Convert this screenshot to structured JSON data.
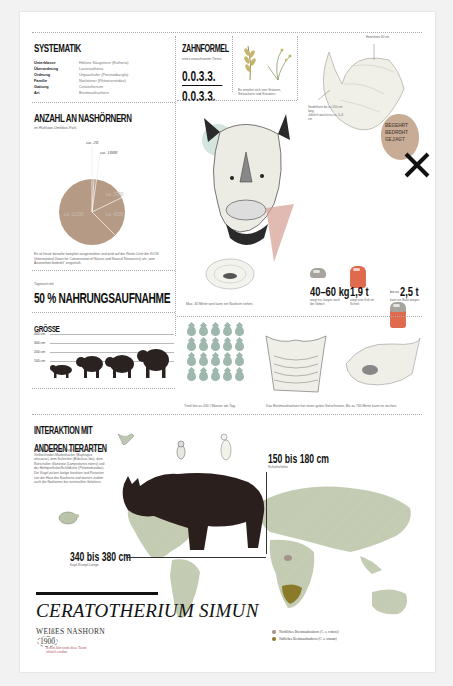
{
  "systematik": {
    "title": "SYSTEMATIK",
    "rows": [
      {
        "key": "Unterklasse",
        "value": "Höhere Säugetiere (Eutheria)"
      },
      {
        "key": "Überordnung",
        "value": "Laurasiatheria"
      },
      {
        "key": "Ordnung",
        "value": "Unpaarhufer (Perissodactyla)"
      },
      {
        "key": "Familie",
        "value": "Nashörner (Rhinocerotidae)"
      },
      {
        "key": "Gattung",
        "value": "Ceratotherium"
      },
      {
        "key": "Art",
        "value": "Breitmaulnashorn"
      }
    ]
  },
  "zahnformel": {
    "title": "ZAHNFORMEL",
    "subtitle": "eines erwachsenen Tieres",
    "upper": "0.0.3.3.",
    "lower": "0.0.3.3.",
    "plant_caption": "Es ernährt sich von Gräsern, Sträuchern und Kräutern."
  },
  "horn": {
    "label_top": "Hinterhorn 40 cm",
    "label_left": "Vorderhorn bis zu 150 cm lang",
    "label_left2": "Jährlich wächst es ca. 5–6 cm",
    "stamp": [
      "BEGEHRT",
      "BEDROHT",
      "GEJAGT"
    ]
  },
  "anzahl": {
    "title": "ANZAHL AN NASHÖRNERN",
    "subtitle": "im Hluhluwe-Umfolozi-Park",
    "caption": "Es ist heute beinahe komplett ausgestorben und wird auf der Roten Liste der IUCN (International Union for Conservation of Nature and Natural Resources) als „vom Aussterben bedroht\" eingestuft."
  },
  "chart_data": {
    "type": "pie",
    "title": "ANZAHL AN NASHÖRNERN",
    "subtitle": "im Hluhluwe-Umfolozi-Park",
    "categories": [
      "ca. 20",
      "ca. 1000",
      "ca. 2000",
      "ca. 4000",
      "ca. 11000"
    ],
    "values": [
      20,
      1000,
      2000,
      4000,
      11000
    ],
    "color": "#b59a86"
  },
  "nahrung": {
    "kicker": "Tageszeit mit",
    "headline": "50 % NAHRUNGSAUFNAHME"
  },
  "groesse": {
    "title": "GRÖSSE",
    "ticks": [
      "400 cm",
      "300 cm",
      "200 cm",
      "100 cm"
    ]
  },
  "head": {
    "caption": "Max. 30 Meter weit kann ein Nashorn sehen."
  },
  "weight": {
    "stats": [
      {
        "prefix": "",
        "value": "40–60 kg",
        "caption": "wiegt ein Junges nach der Geburt"
      },
      {
        "prefix": "",
        "value": "1,9 t",
        "caption": "wiegt eine Kuh im Schnitt"
      },
      {
        "prefix": "bis zu",
        "value": "2,5 t",
        "caption": "kann ein Bulle wiegen"
      }
    ]
  },
  "water": {
    "caption": "Trinkt bis zu 200 l Wasser am Tag."
  },
  "smell": {
    "caption": "Das Breitmaulnashorn hat einen guten Geruchssinn. Bis zu 730 Meter kann es riechen."
  },
  "interaktion": {
    "title_line1": "INTERAKTION MIT",
    "title_line2": "ANDEREN TIERARTEN",
    "body": "Symbiotische Beziehungen gibt es mit dem Gelbschnabel-Madenhacker (Buphagus africanus), dem Kuhreiher (Bubulcus ibis), dem Rotschulter-Glanzstar (Lamprotornis nitens) und der Helmperlhuhn/Schildkröte (Pelomedusidae). Die Vögel picken lästige Insekten und Parasiten von der Haut des Nashorns und warnen zudem auch die Nashörner bei eventuellen Gefahren."
  },
  "dimensions": {
    "height_value": "150 bis 180 cm",
    "height_label": "Schulterhöhe",
    "length_value": "340 bis 380 cm",
    "length_label": "Kopf-Rumpf-Länge"
  },
  "title": {
    "latin": "CERATOTHERIUM SIMUN",
    "common": "WEIßES NASHORN",
    "year": "1900",
    "note": "In dem Jahr wurde diese Tierart offiziell erwähnt"
  },
  "legend": {
    "items": [
      {
        "label": "Nördliches Breitmaulnashorn (C. s. cottoni)",
        "color": "#a8908a"
      },
      {
        "label": "Südliches Breitmaulnashorn (C. s. simum)",
        "color": "#8a7a2a"
      }
    ]
  },
  "colors": {
    "pie": "#b59a86",
    "car_red": "#e06a4e",
    "car_grey": "#a6a49c",
    "drop": "#9fb8ad",
    "map": "#c5cdb5",
    "stamp": "#c4a48a"
  }
}
